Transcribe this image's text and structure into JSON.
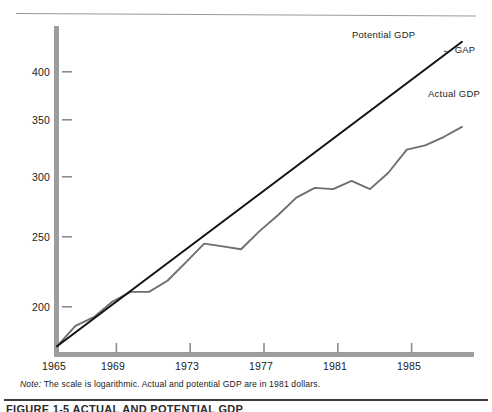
{
  "figure": {
    "note_prefix": "Note:",
    "note_text": "The scale is logarithmic. Actual and potential GDP are in 1981 dollars.",
    "caption": "FIGURE 1-5   ACTUAL AND POTENTIAL GDP"
  },
  "labels": {
    "potential": "Potential GDP",
    "gap": "← GAP",
    "actual": "Actual GDP"
  },
  "colors": {
    "axis": "#9d9d9d",
    "potential_line": "#111111",
    "actual_line": "#6e6e6e",
    "text": "#1a1a1a",
    "top_rule": "#9a9a9a"
  },
  "chart_data": {
    "type": "line",
    "title": "",
    "subtitle": "",
    "xlabel": "",
    "ylabel": "",
    "scale": "logarithmic",
    "units": "1981 dollars",
    "grid": false,
    "legend_position": "inline-annotations",
    "xlim": [
      1965,
      1987
    ],
    "ylim": [
      175,
      440
    ],
    "xticks": [
      1965,
      1969,
      1973,
      1977,
      1981,
      1985
    ],
    "xtick_labels": [
      "1965",
      "1969",
      "1973",
      "1977",
      "1981",
      "1985"
    ],
    "yticks": [
      200,
      250,
      300,
      350,
      400
    ],
    "ytick_labels": [
      "200",
      "250",
      "300",
      "350",
      "400"
    ],
    "annotations": [
      {
        "text": "Potential GDP",
        "x": 1984.0,
        "y": 430
      },
      {
        "text": "← GAP",
        "x": 1986.2,
        "y": 408
      },
      {
        "text": "Actual GDP",
        "x": 1986.0,
        "y": 370
      }
    ],
    "series": [
      {
        "name": "Potential GDP",
        "color": "#111111",
        "x": [
          1965,
          1987
        ],
        "values": [
          178,
          437
        ]
      },
      {
        "name": "Actual GDP",
        "color": "#6e6e6e",
        "x": [
          1965,
          1966,
          1967,
          1968,
          1969,
          1970,
          1971,
          1972,
          1973,
          1974,
          1975,
          1976,
          1977,
          1978,
          1979,
          1980,
          1981,
          1982,
          1983,
          1984,
          1985,
          1986,
          1987
        ],
        "values": [
          178,
          189,
          194,
          203,
          209,
          209,
          216,
          228,
          241,
          239,
          237,
          250,
          262,
          276,
          284,
          283,
          290,
          283,
          297,
          318,
          322,
          330,
          340
        ]
      }
    ]
  }
}
